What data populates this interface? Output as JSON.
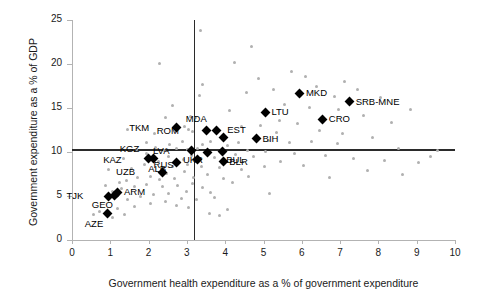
{
  "chart_data": {
    "type": "scatter",
    "title": "",
    "xlabel": "Government health expenditure as a % of government expenditure",
    "ylabel": "Government expenditure as a % of GDP",
    "xlim": [
      0,
      10
    ],
    "ylim": [
      0,
      25
    ],
    "xticks": [
      0,
      1,
      2,
      3,
      4,
      5,
      6,
      7,
      8,
      9,
      10
    ],
    "yticks": [
      0,
      5,
      10,
      15,
      20,
      25
    ],
    "grid": false,
    "legend": null,
    "reference_lines": [
      {
        "name": "vertical-median",
        "orientation": "vertical",
        "value": 3.2
      },
      {
        "name": "horizontal-median",
        "orientation": "horizontal",
        "value": 10.2
      }
    ],
    "series": [
      {
        "name": "labelled-countries",
        "marker": "diamond",
        "color": "#000000",
        "points": [
          {
            "label": "TKM",
            "x": 2.72,
            "y": 12.75,
            "label_dx": -27,
            "label_dy": -4
          },
          {
            "label": "MDA",
            "x": 3.78,
            "y": 12.45,
            "label_dx": -10,
            "label_dy": -15
          },
          {
            "label": "ROM",
            "x": 3.52,
            "y": 12.4,
            "label_dx": -28,
            "label_dy": -4
          },
          {
            "label": "EST",
            "x": 3.95,
            "y": 11.6,
            "label_dx": 4,
            "label_dy": -12
          },
          {
            "label": "LTU",
            "x": 5.05,
            "y": 14.5,
            "label_dx": 6,
            "label_dy": -4
          },
          {
            "label": "MKD",
            "x": 5.95,
            "y": 16.7,
            "label_dx": 6,
            "label_dy": -4
          },
          {
            "label": "SRB-MNE",
            "x": 7.25,
            "y": 15.7,
            "label_dx": 6,
            "label_dy": -4
          },
          {
            "label": "CRO",
            "x": 6.55,
            "y": 13.7,
            "label_dx": 6,
            "label_dy": -4
          },
          {
            "label": "BIH",
            "x": 4.82,
            "y": 11.5,
            "label_dx": 6,
            "label_dy": -4
          },
          {
            "label": "LVA",
            "x": 3.12,
            "y": 10.15,
            "label_dx": -22,
            "label_dy": -4
          },
          {
            "label": "UKR",
            "x": 3.55,
            "y": 9.95,
            "label_dx": -5,
            "label_dy": 4
          },
          {
            "label": "BUL",
            "x": 3.92,
            "y": 10.05,
            "label_dx": 4,
            "label_dy": 4
          },
          {
            "label": "BLR",
            "x": 3.95,
            "y": 8.95,
            "label_dx": 6,
            "label_dy": -3
          },
          {
            "label": "RUS",
            "x": 3.28,
            "y": 9.2,
            "label_dx": -24,
            "label_dy": 2
          },
          {
            "label": "ALB",
            "x": 2.72,
            "y": 8.85,
            "label_dx": -10,
            "label_dy": 3
          },
          {
            "label": "UZB",
            "x": 2.35,
            "y": 7.7,
            "label_dx": -27,
            "label_dy": -4
          },
          {
            "label": "KAZ",
            "x": 2.0,
            "y": 9.25,
            "label_dx": -27,
            "label_dy": -3
          },
          {
            "label": "KGZ",
            "x": 2.12,
            "y": 9.3,
            "label_dx": -14,
            "label_dy": -13
          },
          {
            "label": "ARM",
            "x": 1.2,
            "y": 5.4,
            "label_dx": 6,
            "label_dy": -4
          },
          {
            "label": "TJK",
            "x": 0.95,
            "y": 5.0,
            "label_dx": -25,
            "label_dy": -4
          },
          {
            "label": "GEO",
            "x": 1.12,
            "y": 5.1,
            "label_dx": -2,
            "label_dy": 6
          },
          {
            "label": "AZE",
            "x": 0.92,
            "y": 3.0,
            "label_dx": -4,
            "label_dy": 6
          }
        ]
      },
      {
        "name": "other-countries",
        "marker": "circle",
        "color": "#b0b0b0",
        "points": [
          {
            "x": 3.35,
            "y": 23.8
          },
          {
            "x": 4.68,
            "y": 21.95
          },
          {
            "x": 2.28,
            "y": 20.05
          },
          {
            "x": 4.25,
            "y": 20.15
          },
          {
            "x": 3.42,
            "y": 17.65
          },
          {
            "x": 4.55,
            "y": 16.8
          },
          {
            "x": 2.62,
            "y": 15.3
          },
          {
            "x": 4.12,
            "y": 14.75
          },
          {
            "x": 3.1,
            "y": 14.05
          },
          {
            "x": 3.22,
            "y": 13.95
          },
          {
            "x": 2.45,
            "y": 13.9
          },
          {
            "x": 5.42,
            "y": 13.6
          },
          {
            "x": 1.45,
            "y": 12.55
          },
          {
            "x": 2.95,
            "y": 12.95
          },
          {
            "x": 3.05,
            "y": 12.6
          },
          {
            "x": 3.15,
            "y": 12.3
          },
          {
            "x": 6.1,
            "y": 18.6
          },
          {
            "x": 6.38,
            "y": 17.45
          },
          {
            "x": 7.12,
            "y": 18.05
          },
          {
            "x": 6.85,
            "y": 16.3
          },
          {
            "x": 7.45,
            "y": 17.05
          },
          {
            "x": 5.72,
            "y": 19.1
          },
          {
            "x": 5.25,
            "y": 17.15
          },
          {
            "x": 8.05,
            "y": 16.2
          },
          {
            "x": 8.85,
            "y": 14.8
          },
          {
            "x": 8.35,
            "y": 13.4
          },
          {
            "x": 7.6,
            "y": 14.2
          },
          {
            "x": 6.95,
            "y": 14.85
          },
          {
            "x": 6.2,
            "y": 15.1
          },
          {
            "x": 5.55,
            "y": 15.45
          },
          {
            "x": 5.9,
            "y": 13.2
          },
          {
            "x": 6.45,
            "y": 12.45
          },
          {
            "x": 7.05,
            "y": 12.1
          },
          {
            "x": 5.35,
            "y": 12.25
          },
          {
            "x": 4.92,
            "y": 13.05
          },
          {
            "x": 4.42,
            "y": 12.85
          },
          {
            "x": 5.12,
            "y": 11.35
          },
          {
            "x": 5.68,
            "y": 11.1
          },
          {
            "x": 6.25,
            "y": 11.25
          },
          {
            "x": 6.92,
            "y": 10.95
          },
          {
            "x": 7.85,
            "y": 11.65
          },
          {
            "x": 8.52,
            "y": 10.45
          },
          {
            "x": 4.35,
            "y": 11.05
          },
          {
            "x": 4.05,
            "y": 10.7
          },
          {
            "x": 3.62,
            "y": 11.15
          },
          {
            "x": 3.42,
            "y": 10.9
          },
          {
            "x": 2.88,
            "y": 11.25
          },
          {
            "x": 2.55,
            "y": 10.85
          },
          {
            "x": 2.18,
            "y": 10.55
          },
          {
            "x": 1.95,
            "y": 11.1
          },
          {
            "x": 1.68,
            "y": 10.3
          },
          {
            "x": 2.72,
            "y": 10.35
          },
          {
            "x": 3.02,
            "y": 10.25
          },
          {
            "x": 3.28,
            "y": 10.45
          },
          {
            "x": 2.42,
            "y": 10.15
          },
          {
            "x": 4.58,
            "y": 10.2
          },
          {
            "x": 5.05,
            "y": 10.05
          },
          {
            "x": 5.82,
            "y": 9.85
          },
          {
            "x": 6.62,
            "y": 9.6
          },
          {
            "x": 7.35,
            "y": 9.25
          },
          {
            "x": 8.15,
            "y": 9.05
          },
          {
            "x": 9.05,
            "y": 8.85
          },
          {
            "x": 4.75,
            "y": 9.45
          },
          {
            "x": 4.28,
            "y": 9.7
          },
          {
            "x": 3.72,
            "y": 9.35
          },
          {
            "x": 3.12,
            "y": 9.6
          },
          {
            "x": 2.92,
            "y": 9.1
          },
          {
            "x": 2.52,
            "y": 9.45
          },
          {
            "x": 2.25,
            "y": 8.95
          },
          {
            "x": 1.88,
            "y": 8.6
          },
          {
            "x": 1.55,
            "y": 8.15
          },
          {
            "x": 2.62,
            "y": 8.4
          },
          {
            "x": 3.02,
            "y": 8.55
          },
          {
            "x": 3.38,
            "y": 8.3
          },
          {
            "x": 3.85,
            "y": 8.2
          },
          {
            "x": 4.42,
            "y": 8.05
          },
          {
            "x": 2.95,
            "y": 7.75
          },
          {
            "x": 2.48,
            "y": 7.55
          },
          {
            "x": 2.05,
            "y": 7.25
          },
          {
            "x": 1.72,
            "y": 7.05
          },
          {
            "x": 1.42,
            "y": 6.75
          },
          {
            "x": 2.28,
            "y": 6.85
          },
          {
            "x": 2.68,
            "y": 6.95
          },
          {
            "x": 3.18,
            "y": 7.15
          },
          {
            "x": 3.55,
            "y": 7.4
          },
          {
            "x": 3.95,
            "y": 7.0
          },
          {
            "x": 3.15,
            "y": 6.45
          },
          {
            "x": 2.75,
            "y": 6.25
          },
          {
            "x": 2.35,
            "y": 6.1
          },
          {
            "x": 1.95,
            "y": 6.35
          },
          {
            "x": 1.62,
            "y": 6.05
          },
          {
            "x": 1.28,
            "y": 5.85
          },
          {
            "x": 3.42,
            "y": 5.95
          },
          {
            "x": 3.62,
            "y": 5.45
          },
          {
            "x": 2.98,
            "y": 5.55
          },
          {
            "x": 2.52,
            "y": 5.3
          },
          {
            "x": 2.12,
            "y": 5.15
          },
          {
            "x": 1.78,
            "y": 4.95
          },
          {
            "x": 1.45,
            "y": 4.65
          },
          {
            "x": 2.85,
            "y": 4.75
          },
          {
            "x": 3.25,
            "y": 4.55
          },
          {
            "x": 3.72,
            "y": 4.85
          },
          {
            "x": 2.45,
            "y": 4.35
          },
          {
            "x": 2.05,
            "y": 4.1
          },
          {
            "x": 1.62,
            "y": 3.85
          },
          {
            "x": 1.18,
            "y": 3.55
          },
          {
            "x": 0.72,
            "y": 3.25
          },
          {
            "x": 0.55,
            "y": 2.85
          },
          {
            "x": 1.05,
            "y": 2.55
          },
          {
            "x": 1.38,
            "y": 2.95
          },
          {
            "x": 2.72,
            "y": 3.95
          },
          {
            "x": 3.05,
            "y": 3.65
          },
          {
            "x": 1.25,
            "y": 6.55
          },
          {
            "x": 1.05,
            "y": 5.55
          },
          {
            "x": 0.88,
            "y": 6.15
          },
          {
            "x": 4.18,
            "y": 6.55
          },
          {
            "x": 4.62,
            "y": 7.25
          },
          {
            "x": 5.02,
            "y": 8.35
          },
          {
            "x": 5.45,
            "y": 8.95
          },
          {
            "x": 6.05,
            "y": 8.45
          },
          {
            "x": 7.72,
            "y": 7.95
          },
          {
            "x": 8.62,
            "y": 7.45
          },
          {
            "x": 9.35,
            "y": 9.45
          },
          {
            "x": 4.05,
            "y": 3.45
          },
          {
            "x": 3.85,
            "y": 2.75
          },
          {
            "x": 5.15,
            "y": 5.25
          },
          {
            "x": 2.15,
            "y": 12.05
          },
          {
            "x": 1.95,
            "y": 9.85
          },
          {
            "x": 1.35,
            "y": 9.25
          },
          {
            "x": 0.95,
            "y": 8.05
          },
          {
            "x": 3.58,
            "y": 3.05
          },
          {
            "x": 6.72,
            "y": 7.05
          },
          {
            "x": 9.55,
            "y": 10.15
          },
          {
            "x": 3.32,
            "y": 16.45
          },
          {
            "x": 4.88,
            "y": 18.35
          }
        ]
      }
    ]
  }
}
